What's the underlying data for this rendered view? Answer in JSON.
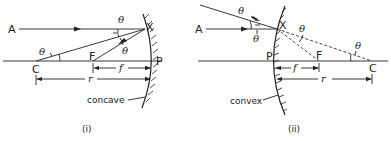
{
  "figures": [
    {
      "id": "i",
      "caption": "(i)",
      "mirror_label": "concave",
      "points": {
        "A": "A",
        "X": "X",
        "C": "C",
        "F": "F",
        "P": "P"
      },
      "angle_symbol": "θ",
      "dimensions": {
        "focal": "f",
        "radius": "r"
      }
    },
    {
      "id": "ii",
      "caption": "(ii)",
      "mirror_label": "convex",
      "points": {
        "A": "A",
        "X": "X",
        "C": "C",
        "F": "F",
        "P": "P"
      },
      "angle_symbol": "θ",
      "dimensions": {
        "focal": "f",
        "radius": "r"
      }
    }
  ]
}
